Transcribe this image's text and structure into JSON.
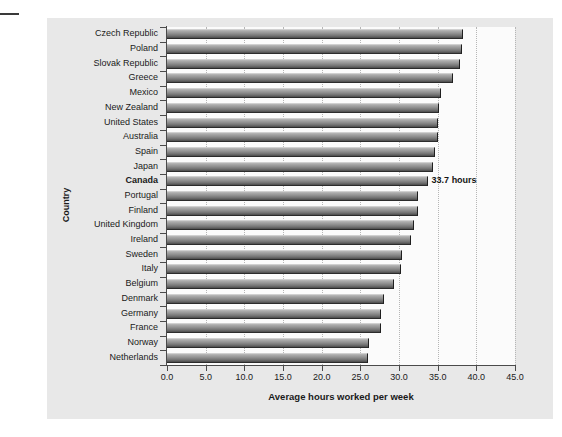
{
  "chart_data": {
    "type": "bar",
    "orientation": "horizontal",
    "title": "",
    "xlabel": "Average hours worked per week",
    "ylabel": "Country",
    "xlim": [
      0.0,
      45.0
    ],
    "xticks": [
      "0.0",
      "5.0",
      "10.0",
      "15.0",
      "20.0",
      "25.0",
      "30.0",
      "35.0",
      "40.0",
      "45.0"
    ],
    "xtick_values": [
      0,
      5,
      10,
      15,
      20,
      25,
      30,
      35,
      40,
      45
    ],
    "grid": "vertical-dotted",
    "legend": "none",
    "categories": [
      "Czech Republic",
      "Poland",
      "Slovak Republic",
      "Greece",
      "Mexico",
      "New Zealand",
      "United States",
      "Australia",
      "Spain",
      "Japan",
      "Canada",
      "Portugal",
      "Finland",
      "United Kingdom",
      "Ireland",
      "Sweden",
      "Italy",
      "Belgium",
      "Denmark",
      "Germany",
      "France",
      "Norway",
      "Netherlands"
    ],
    "values": [
      38.3,
      38.2,
      37.9,
      37.0,
      35.4,
      35.2,
      35.1,
      35.0,
      34.6,
      34.4,
      33.7,
      32.5,
      32.4,
      32.0,
      31.5,
      30.4,
      30.3,
      29.3,
      28.0,
      27.7,
      27.7,
      26.1,
      26.0
    ],
    "highlight_category": "Canada",
    "annotations": [
      {
        "category": "Canada",
        "text": "33.7 hours",
        "value": 33.7
      }
    ]
  },
  "axis": {
    "y_title": "Country",
    "x_title": "Average hours worked per week"
  }
}
